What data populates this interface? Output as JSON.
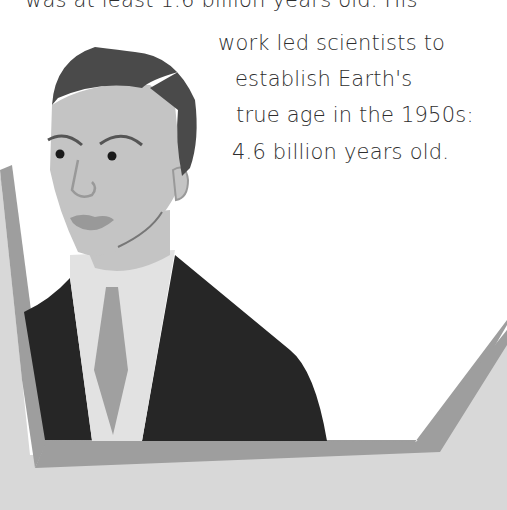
{
  "caption": {
    "lines": [
      "was at least 1.6 billion years old. His",
      "work led scientists to",
      "establish Earth's",
      "true age in the 1950s:",
      "4.6 billion years old."
    ]
  },
  "illustration": {
    "subject": "portrait-of-man-in-suit",
    "colors": {
      "background": "#ffffff",
      "hair": "#4a4a4a",
      "skin": "#c4c4c4",
      "features": "#555555",
      "lips": "#999999",
      "eyes": "#1a1a1a",
      "shirt": "#e2e2e2",
      "tie": "#a0a0a0",
      "suit": "#262626",
      "frame": "#9e9e9e",
      "ground": "#d8d8d8"
    }
  }
}
